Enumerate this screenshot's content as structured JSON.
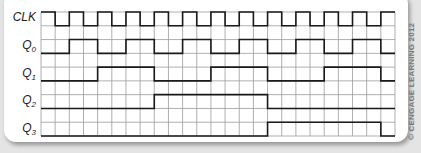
{
  "title": "",
  "signals": [
    {
      "name": "CLK",
      "label_main": "CLK",
      "label_sub": ""
    },
    {
      "name": "Q0",
      "label_main": "Q",
      "label_sub": "0"
    },
    {
      "name": "Q1",
      "label_main": "Q",
      "label_sub": "1"
    },
    {
      "name": "Q2",
      "label_main": "Q",
      "label_sub": "2"
    },
    {
      "name": "Q3",
      "label_main": "Q",
      "label_sub": "3"
    }
  ],
  "copyright": "© CENGAGE LEARNING 2012",
  "grid": {
    "columns": 25,
    "rows": 9,
    "line_color": "#9a9a9a",
    "signal_color": "#1a1a1a"
  },
  "chart_data": {
    "type": "timing-diagram",
    "time_units": 25,
    "series": [
      {
        "name": "CLK",
        "values": [
          1,
          0,
          1,
          0,
          1,
          0,
          1,
          0,
          1,
          0,
          1,
          0,
          1,
          0,
          1,
          0,
          1,
          0,
          1,
          0,
          1,
          0,
          1,
          0,
          1
        ]
      },
      {
        "name": "Q0",
        "values": [
          0,
          0,
          1,
          1,
          0,
          0,
          1,
          1,
          0,
          0,
          1,
          1,
          0,
          0,
          1,
          1,
          0,
          0,
          1,
          1,
          0,
          0,
          1,
          1,
          0
        ]
      },
      {
        "name": "Q1",
        "values": [
          0,
          0,
          0,
          0,
          1,
          1,
          1,
          1,
          0,
          0,
          0,
          0,
          1,
          1,
          1,
          1,
          0,
          0,
          0,
          0,
          1,
          1,
          1,
          1,
          0
        ]
      },
      {
        "name": "Q2",
        "values": [
          0,
          0,
          0,
          0,
          0,
          0,
          0,
          0,
          1,
          1,
          1,
          1,
          1,
          1,
          1,
          1,
          0,
          0,
          0,
          0,
          0,
          0,
          0,
          0,
          0
        ]
      },
      {
        "name": "Q3",
        "values": [
          0,
          0,
          0,
          0,
          0,
          0,
          0,
          0,
          0,
          0,
          0,
          0,
          0,
          0,
          0,
          0,
          1,
          1,
          1,
          1,
          1,
          1,
          1,
          1,
          0
        ]
      }
    ]
  }
}
